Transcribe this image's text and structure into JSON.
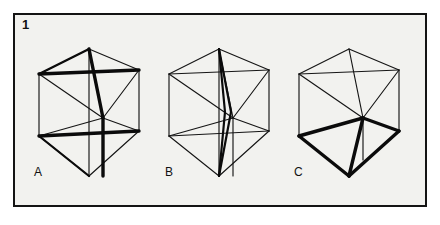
{
  "plate": {
    "figure_number": "1",
    "background_color": "#f2f2ef",
    "border_color": "#141414",
    "line_color": "#151515",
    "bold_line_color": "#0b0b0b"
  },
  "panels": [
    {
      "id": "A",
      "label": "A",
      "description": "Cube outline with two bold crossed diagonals forming X shapes on the upper and lower rhombic faces",
      "emphasis": "double-x"
    },
    {
      "id": "B",
      "label": "B",
      "description": "Cube outline with all face diagonals thin and a narrow bold vertical spindle through the centre from top apex to bottom apex",
      "emphasis": "vertical-spindle"
    },
    {
      "id": "C",
      "label": "C",
      "description": "Cube outline with a bold pyramid formed from the centre vertex down to the lower hexagon edges",
      "emphasis": "pyramid"
    }
  ],
  "geometry": {
    "cube_width": 101,
    "cube_height": 128,
    "centers": [
      {
        "panel": "A",
        "cx": 89,
        "cy": 112
      },
      {
        "panel": "B",
        "cx": 219,
        "cy": 112
      },
      {
        "panel": "C",
        "cx": 349,
        "cy": 112
      }
    ],
    "vertex_names": [
      "top-apex",
      "upper-left",
      "upper-right",
      "centre",
      "lower-left",
      "lower-right",
      "bottom-apex"
    ]
  }
}
